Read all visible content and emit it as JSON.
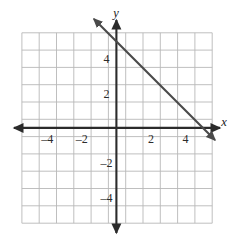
{
  "figure": {
    "background_color": "#ffffff",
    "artifact_text": "scanned page bleed-through (illegible)"
  },
  "chart_data": {
    "type": "line",
    "title": "",
    "subtitle": "",
    "xlabel": "x",
    "ylabel": "y",
    "xlim": [
      -5.5,
      5.5
    ],
    "ylim": [
      -5.5,
      5.5
    ],
    "grid": true,
    "grid_step": 1,
    "legend": "none",
    "axis_arrows": [
      "left",
      "right",
      "up",
      "down"
    ],
    "x_tick_labels": [
      "-4",
      "-2",
      "2",
      "4"
    ],
    "x_tick_values": [
      -4,
      -2,
      2,
      4
    ],
    "y_tick_labels": [
      "4",
      "2",
      "-2",
      "-4"
    ],
    "y_tick_values": [
      4,
      2,
      -2,
      -4
    ],
    "series": [
      {
        "name": "line",
        "kind": "line",
        "slope": -1,
        "intercept": 5,
        "equation": "y = -x + 5",
        "x_intercept": 5,
        "y_intercept": 5,
        "arrows": "both",
        "x": [
          -1.3,
          5.7
        ],
        "y": [
          6.3,
          -0.7
        ],
        "color": "#4a4a4a"
      }
    ],
    "colors": {
      "grid": "#b8b8b8",
      "axis": "#2b2b2b",
      "line": "#4a4a4a",
      "text": "#2b2b2b",
      "background": "#ffffff"
    }
  },
  "labels": {
    "x_axis_name": "x",
    "y_axis_name": "y",
    "x_neg4": "–4",
    "x_neg2": "–2",
    "x_pos2": "2",
    "x_pos4": "4",
    "y_pos4": "4",
    "y_pos2": "2",
    "y_neg2": "–2",
    "y_neg4": "–4"
  }
}
